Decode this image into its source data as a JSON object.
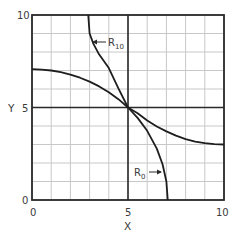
{
  "chart_data": {
    "type": "line",
    "title": "",
    "xlabel": "X",
    "ylabel": "Y",
    "xlim": [
      0,
      10
    ],
    "ylim": [
      0,
      10
    ],
    "grid": true,
    "grid_step": 1,
    "x_ticks": [
      "0",
      "5",
      "10"
    ],
    "y_ticks": [
      "0",
      "5",
      "10"
    ],
    "reference_lines": {
      "x": 5,
      "y": 5
    },
    "series": [
      {
        "name": "R10",
        "label_main": "R",
        "label_sub": "10",
        "description": "Arc of circle centered at (10,10), radius ~7.07",
        "x": [
          2.93,
          3.0,
          3.2,
          3.5,
          4.0,
          4.5,
          5.0,
          5.5,
          6.0,
          6.5,
          7.0,
          7.5,
          8.0,
          8.5,
          9.0,
          9.5,
          10.0
        ],
        "y": [
          10.0,
          9.0,
          8.44,
          7.86,
          7.13,
          6.03,
          5.0,
          4.69,
          4.3,
          3.97,
          3.71,
          3.48,
          3.29,
          3.16,
          3.07,
          3.02,
          3.0
        ]
      },
      {
        "name": "R0",
        "label_main": "R",
        "label_sub": "0",
        "description": "Arc of circle centered at (0,0), radius ~7.07",
        "x": [
          0.0,
          0.5,
          1.0,
          1.5,
          2.0,
          2.5,
          3.0,
          3.5,
          4.0,
          4.5,
          5.0,
          5.5,
          6.0,
          6.5,
          6.8,
          7.0,
          7.07
        ],
        "y": [
          7.07,
          7.05,
          7.0,
          6.91,
          6.78,
          6.61,
          6.4,
          6.14,
          5.83,
          5.45,
          5.0,
          4.44,
          3.74,
          2.78,
          1.93,
          1.0,
          0.0
        ]
      }
    ],
    "annotations": [
      {
        "text": "R10",
        "points_to": "R10",
        "at": [
          3.2,
          8.6
        ]
      },
      {
        "text": "R0",
        "points_to": "R0",
        "at": [
          6.8,
          1.7
        ]
      }
    ]
  },
  "labels": {
    "x_axis": "X",
    "y_axis": "Y",
    "x_tick_0": "0",
    "x_tick_5": "5",
    "x_tick_10": "10",
    "y_tick_0": "0",
    "y_tick_5": "5",
    "y_tick_10": "10",
    "r10_main": "R",
    "r10_sub": "10",
    "r0_main": "R",
    "r0_sub": "0"
  },
  "colors": {
    "grid": "#c8c8c8",
    "frame": "#2a2a2a",
    "curve": "#1e1e1e",
    "text": "#3a3a3a"
  }
}
